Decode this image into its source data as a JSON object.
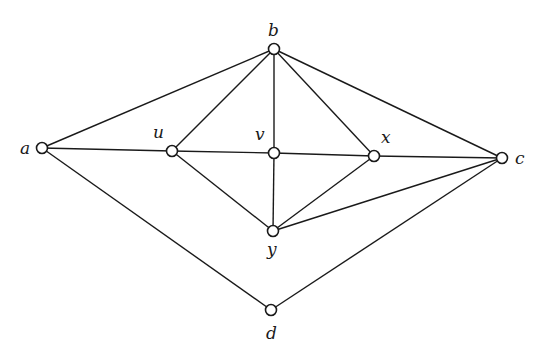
{
  "graph": {
    "nodes": [
      {
        "id": "a",
        "label": "a",
        "x": 42,
        "y": 148,
        "lx": 20,
        "ly": 154
      },
      {
        "id": "b",
        "label": "b",
        "x": 274,
        "y": 49,
        "lx": 268,
        "ly": 36
      },
      {
        "id": "u",
        "label": "u",
        "x": 172,
        "y": 151,
        "lx": 153,
        "ly": 138
      },
      {
        "id": "v",
        "label": "v",
        "x": 274,
        "y": 153,
        "lx": 255,
        "ly": 140
      },
      {
        "id": "x",
        "label": "x",
        "x": 374,
        "y": 156,
        "lx": 381,
        "ly": 143
      },
      {
        "id": "c",
        "label": "c",
        "x": 502,
        "y": 158,
        "lx": 515,
        "ly": 164
      },
      {
        "id": "y",
        "label": "y",
        "x": 273,
        "y": 231,
        "lx": 267,
        "ly": 255
      },
      {
        "id": "d",
        "label": "d",
        "x": 271,
        "y": 310,
        "lx": 266,
        "ly": 339
      }
    ],
    "edges": [
      [
        "a",
        "b"
      ],
      [
        "a",
        "u"
      ],
      [
        "a",
        "d"
      ],
      [
        "u",
        "v"
      ],
      [
        "v",
        "x"
      ],
      [
        "x",
        "c"
      ],
      [
        "b",
        "u"
      ],
      [
        "b",
        "v"
      ],
      [
        "b",
        "x"
      ],
      [
        "b",
        "c"
      ],
      [
        "u",
        "y"
      ],
      [
        "v",
        "y"
      ],
      [
        "x",
        "y"
      ],
      [
        "y",
        "c"
      ],
      [
        "d",
        "c"
      ]
    ]
  }
}
